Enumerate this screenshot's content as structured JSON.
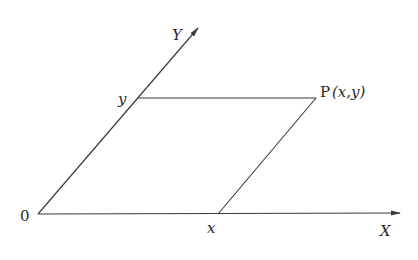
{
  "diagram": {
    "labels": {
      "origin": "0",
      "x_axis": "X",
      "y_axis": "Y",
      "x_coord": "x",
      "y_coord": "y",
      "point_name": "P",
      "point_coords": "(x,y)"
    },
    "colors": {
      "line": "#3a3a3a",
      "text": "#2a2a2a",
      "background": "#ffffff"
    }
  }
}
